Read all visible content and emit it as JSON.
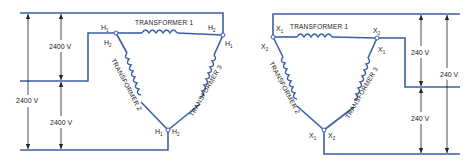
{
  "left_diagram": {
    "name": "primary-delta",
    "transformers": [
      "TRANSFORMER 1",
      "TRANSFORMER 2",
      "TRANSFORMER 3"
    ],
    "terminals": {
      "t1_left": {
        "main": "H",
        "sub": "1"
      },
      "t1_right": {
        "main": "H",
        "sub": "2"
      },
      "t2_top": {
        "main": "H",
        "sub": "2"
      },
      "t2_bottom": {
        "main": "H",
        "sub": "1"
      },
      "t3_top": {
        "main": "H",
        "sub": "1"
      },
      "t3_bottom": {
        "main": "H",
        "sub": "2"
      }
    },
    "voltages": {
      "upper": "2400 V",
      "lower": "2400 V",
      "full": "2400 V"
    }
  },
  "right_diagram": {
    "name": "secondary-delta",
    "transformers": [
      "TRANSFORMER 1",
      "TRANSFORMER 2",
      "TRANSFORMER 3"
    ],
    "terminals": {
      "t1_left": {
        "main": "X",
        "sub": "1"
      },
      "t1_right": {
        "main": "X",
        "sub": "2"
      },
      "t2_top": {
        "main": "X",
        "sub": "2"
      },
      "t2_bottom": {
        "main": "X",
        "sub": "1"
      },
      "t3_top": {
        "main": "X",
        "sub": "1"
      },
      "t3_bottom": {
        "main": "X",
        "sub": "2"
      }
    },
    "voltages": {
      "upper": "240 V",
      "lower": "240 V",
      "full": "240 V"
    }
  },
  "colors": {
    "wire": "#3a5fa8",
    "text": "#222222"
  }
}
